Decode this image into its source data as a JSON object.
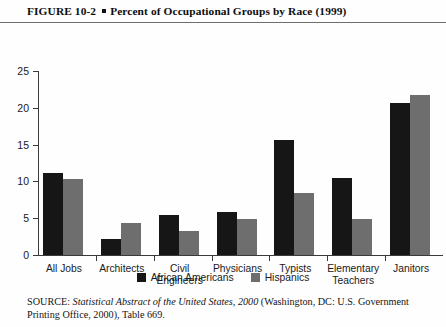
{
  "figure": {
    "number": "FIGURE  10-2",
    "bullet_icon": "square-bullet-icon",
    "title": "Percent of Occupational Groups by Race (1999)"
  },
  "source": {
    "prefix": "SOURCE:",
    "italic_title": "Statistical Abstract of the United States, 2000",
    "rest": " (Washington, DC: U.S. Government Printing Office, 2000), Table 669."
  },
  "chart_data": {
    "type": "bar",
    "title": "Percent of Occupational Groups by Race (1999)",
    "xlabel": "",
    "ylabel": "",
    "ylim": [
      0,
      25
    ],
    "yticks": [
      0,
      5,
      10,
      15,
      20,
      25
    ],
    "grid": false,
    "legend_position": "bottom-center",
    "categories": [
      "All Jobs",
      "Architects",
      "Civil Engineers",
      "Physicians",
      "Typists",
      "Elementary Teachers",
      "Janitors"
    ],
    "category_lines": [
      [
        "All Jobs"
      ],
      [
        "Architects"
      ],
      [
        "Civil",
        "Engineers"
      ],
      [
        "Physicians"
      ],
      [
        "Typists"
      ],
      [
        "Elementary",
        "Teachers"
      ],
      [
        "Janitors"
      ]
    ],
    "series": [
      {
        "name": "African Americans",
        "color": "#161616",
        "values": [
          11.2,
          2.2,
          5.4,
          5.8,
          15.6,
          10.5,
          20.6
        ]
      },
      {
        "name": "Hispanics",
        "color": "#6e6e6e",
        "values": [
          10.3,
          4.4,
          3.3,
          4.9,
          8.4,
          4.9,
          21.8
        ]
      }
    ]
  }
}
